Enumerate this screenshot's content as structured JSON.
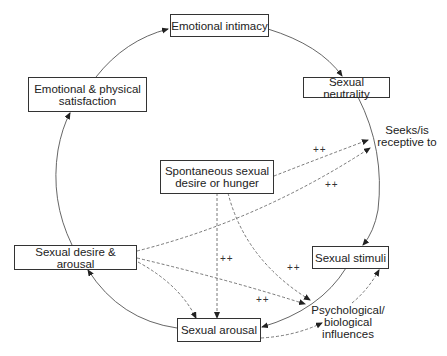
{
  "diagram": {
    "nodes": {
      "emotional_intimacy": "Emotional intimacy",
      "sexual_neutrality": "Sexual neutrality",
      "emotional_physical_satisfaction_line1": "Emotional & physical",
      "emotional_physical_satisfaction_line2": "satisfaction",
      "spontaneous_line1": "Spontaneous sexual",
      "spontaneous_line2": "desire or hunger",
      "sexual_desire_arousal": "Sexual desire & arousal",
      "sexual_stimuli": "Sexual stimuli",
      "sexual_arousal": "Sexual arousal"
    },
    "labels": {
      "seeks_line1": "Seeks/is",
      "seeks_line2": "receptive to",
      "psych_line1": "Psychological/",
      "psych_line2": "biological",
      "psych_line3": "influences"
    },
    "enhancers": [
      "++",
      "++",
      "++",
      "++",
      "++"
    ],
    "edges": [
      {
        "from": "Emotional intimacy",
        "to": "Sexual neutrality",
        "style": "solid"
      },
      {
        "from": "Sexual neutrality",
        "to": "Sexual stimuli",
        "style": "solid"
      },
      {
        "from": "Sexual stimuli",
        "to": "Sexual arousal",
        "style": "solid"
      },
      {
        "from": "Sexual arousal",
        "to": "Sexual desire & arousal",
        "style": "solid"
      },
      {
        "from": "Sexual desire & arousal",
        "to": "Emotional & physical satisfaction",
        "style": "solid"
      },
      {
        "from": "Emotional & physical satisfaction",
        "to": "Emotional intimacy",
        "style": "solid"
      },
      {
        "from": "Spontaneous sexual desire or hunger",
        "to": "Seeks/is receptive to",
        "style": "dashed",
        "label": "++"
      },
      {
        "from": "Sexual desire & arousal",
        "to": "Seeks/is receptive to",
        "style": "dashed",
        "label": "++"
      },
      {
        "from": "Spontaneous sexual desire or hunger",
        "to": "Sexual arousal",
        "style": "dashed",
        "label": "++"
      },
      {
        "from": "Spontaneous sexual desire or hunger",
        "to": "Psychological/biological influences",
        "style": "dashed",
        "label": "++"
      },
      {
        "from": "Sexual desire & arousal",
        "to": "Psychological/biological influences",
        "style": "dashed",
        "label": "++"
      },
      {
        "from": "Sexual desire & arousal",
        "to": "Sexual arousal",
        "style": "dashed"
      },
      {
        "from": "Sexual arousal",
        "to": "Psychological/biological influences",
        "style": "dashed"
      },
      {
        "from": "Psychological/biological influences",
        "to": "Sexual stimuli",
        "style": "dashed"
      }
    ]
  }
}
